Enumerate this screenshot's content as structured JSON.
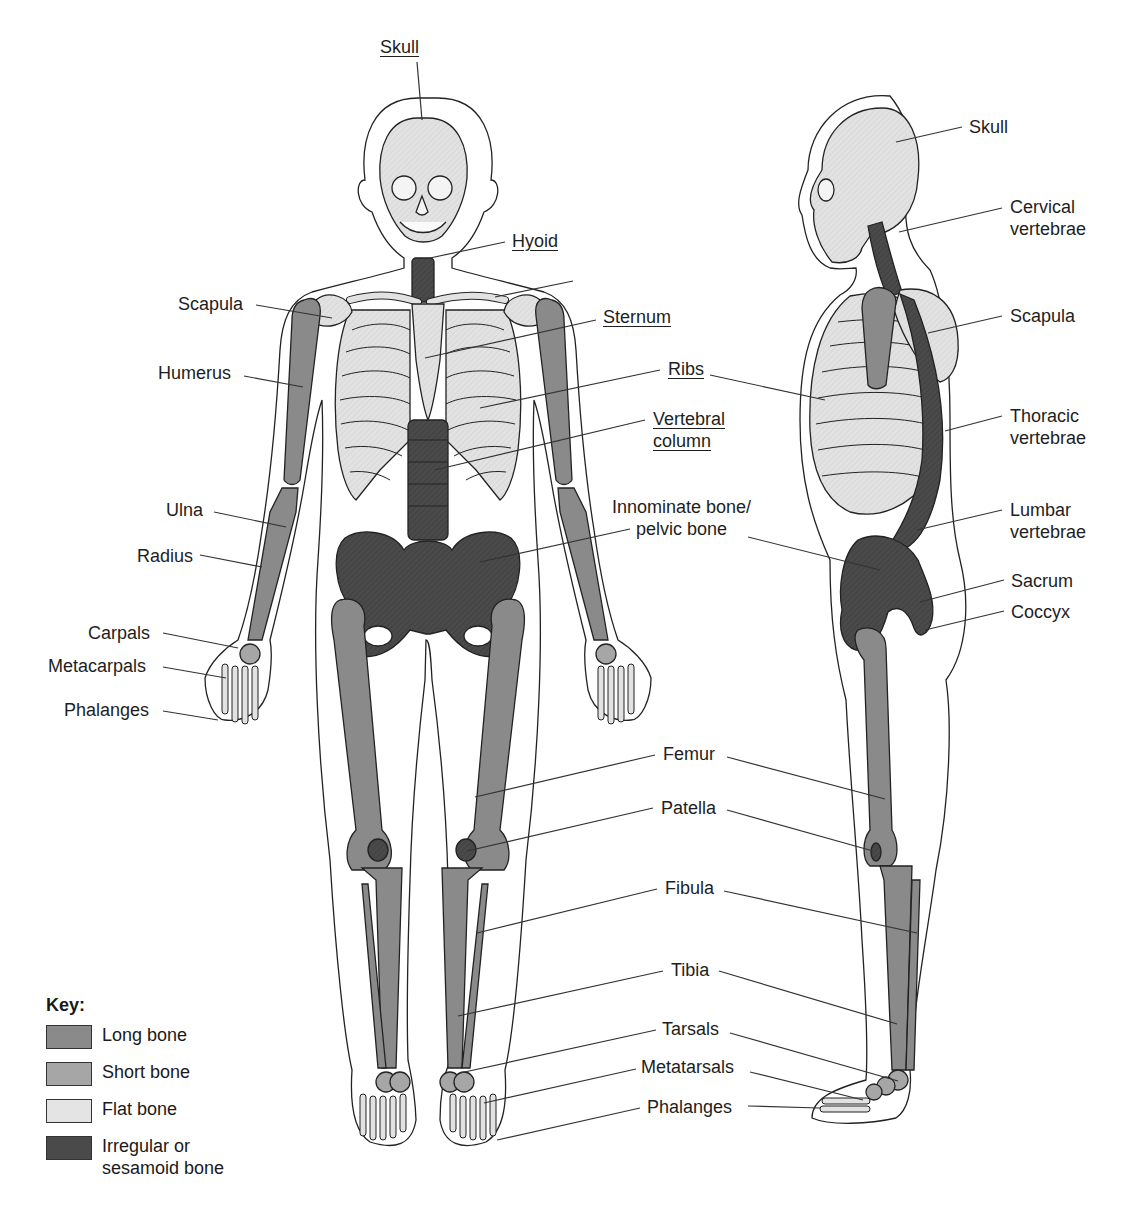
{
  "colors": {
    "long_bone": "#8a8a8a",
    "short_bone": "#a6a6a6",
    "flat_bone": "#e2e2e2",
    "irregular_bone": "#4a4a4a",
    "outline": "#222222",
    "leader": "#333333"
  },
  "front_view": {
    "labels": [
      {
        "id": "skull",
        "text": "Skull",
        "x": 380,
        "y": 36,
        "underline": true,
        "line": [
          417,
          62,
          422,
          120
        ]
      },
      {
        "id": "hyoid",
        "text": "Hyoid",
        "x": 512,
        "y": 230,
        "underline": true,
        "line": [
          505,
          242,
          430,
          258
        ]
      },
      {
        "id": "clavicle-line",
        "text": "",
        "x": 0,
        "y": 0,
        "underline": false,
        "line": [
          573,
          281,
          495,
          297
        ]
      },
      {
        "id": "scapula",
        "text": "Scapula",
        "x": 178,
        "y": 293,
        "underline": false,
        "line": [
          256,
          305,
          332,
          318
        ]
      },
      {
        "id": "sternum",
        "text": "Sternum",
        "x": 603,
        "y": 306,
        "underline": true,
        "line": [
          596,
          320,
          425,
          358
        ]
      },
      {
        "id": "humerus",
        "text": "Humerus",
        "x": 158,
        "y": 362,
        "underline": false,
        "line": [
          244,
          376,
          303,
          387
        ]
      },
      {
        "id": "ribs",
        "text": "Ribs",
        "x": 668,
        "y": 358,
        "underline": true,
        "line": [
          660,
          370,
          480,
          408
        ]
      },
      {
        "id": "vertebral-column",
        "text": "Vertebral\ncolumn",
        "x": 653,
        "y": 408,
        "underline": true,
        "line": [
          645,
          420,
          435,
          470
        ]
      },
      {
        "id": "ulna",
        "text": "Ulna",
        "x": 166,
        "y": 499,
        "underline": false,
        "line": [
          214,
          512,
          286,
          527
        ]
      },
      {
        "id": "innominate",
        "text": "Innominate bone/\npelvic bone",
        "x": 612,
        "y": 496,
        "underline": false,
        "center": true,
        "line": [
          630,
          529,
          480,
          562
        ]
      },
      {
        "id": "radius",
        "text": "Radius",
        "x": 137,
        "y": 545,
        "underline": false,
        "line": [
          200,
          555,
          262,
          567
        ]
      },
      {
        "id": "carpals",
        "text": "Carpals",
        "x": 88,
        "y": 622,
        "underline": false,
        "line": [
          163,
          633,
          238,
          648
        ]
      },
      {
        "id": "metacarpals",
        "text": "Metacarpals",
        "x": 48,
        "y": 655,
        "underline": false,
        "line": [
          163,
          667,
          226,
          678
        ]
      },
      {
        "id": "phalanges-hand",
        "text": "Phalanges",
        "x": 64,
        "y": 699,
        "underline": false,
        "line": [
          163,
          711,
          218,
          720
        ]
      },
      {
        "id": "femur",
        "text": "Femur",
        "x": 663,
        "y": 743,
        "underline": false,
        "line": [
          655,
          755,
          475,
          797
        ]
      },
      {
        "id": "patella",
        "text": "Patella",
        "x": 661,
        "y": 797,
        "underline": false,
        "line": [
          653,
          808,
          467,
          851
        ]
      },
      {
        "id": "fibula",
        "text": "Fibula",
        "x": 665,
        "y": 877,
        "underline": false,
        "line": [
          657,
          889,
          477,
          933
        ]
      },
      {
        "id": "tibia",
        "text": "Tibia",
        "x": 671,
        "y": 959,
        "underline": false,
        "line": [
          663,
          971,
          458,
          1016
        ]
      },
      {
        "id": "tarsals",
        "text": "Tarsals",
        "x": 662,
        "y": 1018,
        "underline": false,
        "line": [
          656,
          1030,
          460,
          1073
        ]
      },
      {
        "id": "metatarsals",
        "text": "Metatarsals",
        "x": 641,
        "y": 1056,
        "underline": false,
        "line": [
          636,
          1069,
          484,
          1103
        ]
      },
      {
        "id": "phalanges-foot",
        "text": "Phalanges",
        "x": 647,
        "y": 1096,
        "underline": false,
        "line": [
          640,
          1108,
          497,
          1140
        ]
      }
    ]
  },
  "side_view": {
    "labels": [
      {
        "id": "skull",
        "text": "Skull",
        "x": 969,
        "y": 116,
        "line": [
          962,
          127,
          896,
          142
        ]
      },
      {
        "id": "cervical-vertebrae",
        "text": "Cervical\nvertebrae",
        "x": 1010,
        "y": 196,
        "line": [
          1002,
          208,
          899,
          232
        ]
      },
      {
        "id": "scapula",
        "text": "Scapula",
        "x": 1010,
        "y": 305,
        "line": [
          1002,
          316,
          928,
          333
        ]
      },
      {
        "id": "thoracic-vertebrae",
        "text": "Thoracic\nvertebrae",
        "x": 1010,
        "y": 405,
        "line": [
          1002,
          416,
          945,
          431
        ]
      },
      {
        "id": "lumbar-vertebrae",
        "text": "Lumbar\nvertebrae",
        "x": 1010,
        "y": 499,
        "line": [
          1002,
          510,
          917,
          530
        ]
      },
      {
        "id": "sacrum",
        "text": "Sacrum",
        "x": 1011,
        "y": 570,
        "line": [
          1004,
          580,
          920,
          602
        ]
      },
      {
        "id": "coccyx",
        "text": "Coccyx",
        "x": 1011,
        "y": 601,
        "line": [
          1004,
          611,
          925,
          630
        ]
      },
      {
        "id": "ribs-side",
        "line": [
          710,
          375,
          825,
          400
        ]
      },
      {
        "id": "pelvis-side",
        "line": [
          748,
          537,
          880,
          570
        ]
      },
      {
        "id": "femur-side",
        "line": [
          727,
          757,
          885,
          799
        ]
      },
      {
        "id": "patella-side",
        "line": [
          727,
          810,
          873,
          851
        ]
      },
      {
        "id": "fibula-side",
        "line": [
          724,
          891,
          917,
          933
        ]
      },
      {
        "id": "tibia-side",
        "line": [
          719,
          971,
          897,
          1024
        ]
      },
      {
        "id": "tarsals-side",
        "line": [
          730,
          1033,
          898,
          1081
        ]
      },
      {
        "id": "metatarsals-side",
        "line": [
          750,
          1072,
          863,
          1100
        ]
      },
      {
        "id": "phalanges-side",
        "line": [
          748,
          1106,
          820,
          1108
        ]
      }
    ]
  },
  "key": {
    "title": "Key:",
    "items": [
      {
        "label": "Long bone",
        "color": "#8a8a8a"
      },
      {
        "label": "Short bone",
        "color": "#a6a6a6"
      },
      {
        "label": "Flat bone",
        "color": "#e4e4e4"
      },
      {
        "label": "Irregular or\nsesamoid bone",
        "color": "#4a4a4a"
      }
    ]
  }
}
